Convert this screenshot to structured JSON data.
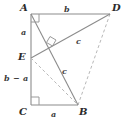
{
  "figure": {
    "kind": "geometry-diagram",
    "background_color": "#ffffff",
    "stroke_color": "#8c8c8c",
    "dashed_stroke_color": "#b5b5b5",
    "label_color": "#2b2b2b"
  },
  "vertices": [
    {
      "id": "A",
      "label": "A",
      "x": 31,
      "y": 14,
      "label_x": 20,
      "label_y": 3
    },
    {
      "id": "D",
      "label": "D",
      "x": 110,
      "y": 14,
      "label_x": 112,
      "label_y": 3
    },
    {
      "id": "E",
      "label": "E",
      "x": 31,
      "y": 58,
      "label_x": 18,
      "label_y": 52
    },
    {
      "id": "C",
      "label": "C",
      "x": 31,
      "y": 105,
      "label_x": 19,
      "label_y": 107
    },
    {
      "id": "B",
      "label": "B",
      "x": 78,
      "y": 105,
      "label_x": 79,
      "label_y": 107
    }
  ],
  "segments": [
    {
      "id": "AD",
      "from": "A",
      "to": "D",
      "style": "solid",
      "name": "top-edge-AD"
    },
    {
      "id": "AE",
      "from": "A",
      "to": "E",
      "style": "solid",
      "name": "left-edge-AE"
    },
    {
      "id": "EC",
      "from": "E",
      "to": "C",
      "style": "solid",
      "name": "left-edge-EC"
    },
    {
      "id": "CB",
      "from": "C",
      "to": "B",
      "style": "solid",
      "name": "bottom-edge-CB"
    },
    {
      "id": "DB",
      "from": "D",
      "to": "B",
      "style": "dashed",
      "name": "right-edge-DB"
    },
    {
      "id": "ED",
      "from": "E",
      "to": "D",
      "style": "solid",
      "name": "hypotenuse-ED"
    },
    {
      "id": "EB",
      "from": "E",
      "to": "B",
      "style": "dashed",
      "name": "diagonal-EB"
    },
    {
      "id": "AB",
      "from": "A",
      "to": "B",
      "style": "solid",
      "name": "hypotenuse-AB"
    }
  ],
  "side_labels": [
    {
      "id": "b_top",
      "text": "b",
      "x": 64,
      "y": 5,
      "for": "AD"
    },
    {
      "id": "a_left",
      "text": "a",
      "x": 21,
      "y": 28,
      "for": "AE"
    },
    {
      "id": "b_a_left",
      "text": "b − a",
      "x": 4,
      "y": 74,
      "for": "EC"
    },
    {
      "id": "a_bottom",
      "text": "a",
      "x": 51,
      "y": 110,
      "for": "CB"
    }
  ],
  "hypotenuse_labels": [
    {
      "id": "c_upper",
      "text": "c",
      "x": 76,
      "y": 37,
      "for": "ED"
    },
    {
      "id": "c_lower",
      "text": "c",
      "x": 62,
      "y": 67,
      "for": "AB"
    }
  ],
  "right_angles": [
    {
      "id": "ra_A",
      "at": "A",
      "x": 31,
      "y": 14,
      "orient": "top-left",
      "size": 7
    },
    {
      "id": "ra_C",
      "at": "C",
      "x": 31,
      "y": 105,
      "orient": "bottom-left",
      "size": 7
    },
    {
      "id": "ra_mid",
      "at": "intersection-ED-AB",
      "x": 50,
      "y": 43,
      "orient": "rotated",
      "size": 7
    }
  ]
}
